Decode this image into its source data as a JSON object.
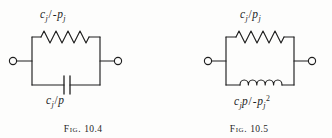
{
  "page": {
    "background_color": "#fdfdfc",
    "ink_color": "#1f1f1f"
  },
  "figures": [
    {
      "id": "fig-10-4",
      "caption_word": "Fig.",
      "caption_number": "10.4",
      "caption_full": "Fig. 10.4",
      "topology": "two-element parallel network with left and right open terminals",
      "top_branch": {
        "element": "resistor",
        "symbol": "zigzag",
        "peaks": 6,
        "label": {
          "full": "c_j/-p_j",
          "numerator": "c",
          "numerator_sub": "j",
          "slash": "/",
          "sign": "-",
          "denominator": "p",
          "denominator_sub": "j",
          "denominator_sup": ""
        }
      },
      "bottom_branch": {
        "element": "capacitor",
        "symbol": "parallel-plates",
        "label": {
          "full": "c_j/p",
          "numerator": "c",
          "numerator_sub": "j",
          "slash": "/",
          "sign": "",
          "denominator": "p",
          "denominator_sub": "",
          "denominator_sup": ""
        }
      },
      "terminals": [
        "left-open-circle",
        "right-open-circle"
      ]
    },
    {
      "id": "fig-10-5",
      "caption_word": "Fig.",
      "caption_number": "10.5",
      "caption_full": "Fig. 10.5",
      "topology": "two-element parallel network with left and right open terminals",
      "top_branch": {
        "element": "resistor",
        "symbol": "zigzag",
        "peaks": 6,
        "label": {
          "full": "c_j/p_j",
          "numerator": "c",
          "numerator_sub": "j",
          "slash": "/",
          "sign": "",
          "denominator": "p",
          "denominator_sub": "j",
          "denominator_sup": ""
        }
      },
      "bottom_branch": {
        "element": "inductor",
        "symbol": "coil",
        "loops": 5,
        "label": {
          "full": "c_j p/-p_j^2",
          "numerator": "c",
          "numerator_sub": "j",
          "numerator_tail": "p",
          "slash": "/",
          "sign": "-",
          "denominator": "p",
          "denominator_sub": "j",
          "denominator_sup": "2"
        }
      },
      "terminals": [
        "left-open-circle",
        "right-open-circle"
      ]
    }
  ]
}
